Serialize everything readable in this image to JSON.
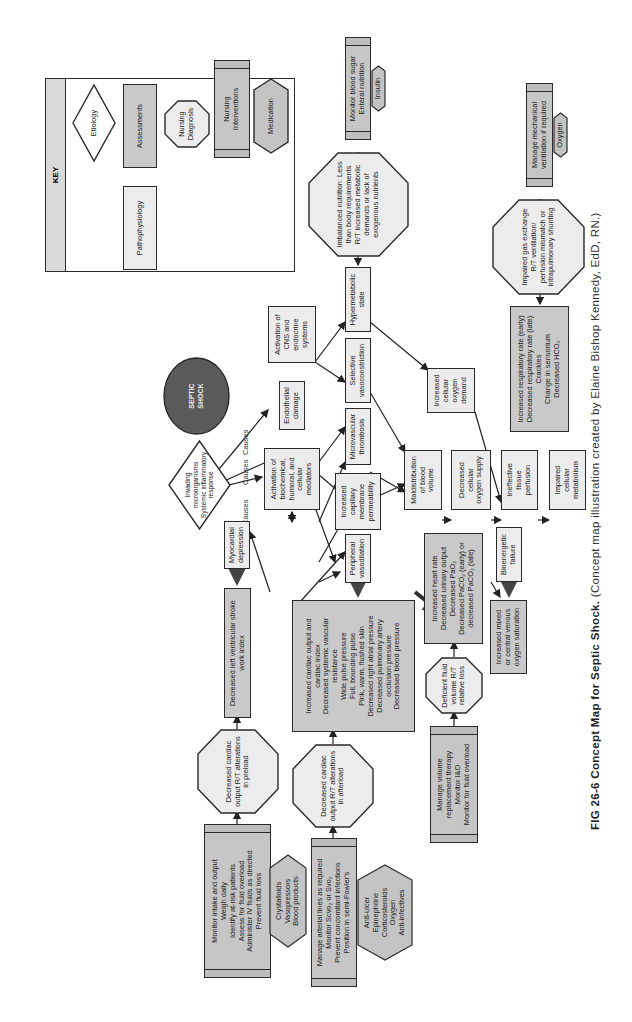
{
  "title": "SEPTIC SHOCK",
  "caption": {
    "label": "FIG 26-6  Concept Map for Septic Shock.",
    "credit": " (Concept map illustration created by Elaine Bishop Kennedy, EdD, RN.)"
  },
  "key": {
    "heading": "KEY",
    "etiology": "Etiology",
    "assessments": "Assessments",
    "pathophysiology": "Pathophysiology",
    "nursing_diagnosis": "Nursing\nDiagnosis",
    "nursing_interventions": "Nursing\nInterventions",
    "medication": "Medication"
  },
  "etiology": "Invading\nmicroorganisms\nSystemic inflammatory\nresponse",
  "causes_label": "Causes",
  "pathophysiology": {
    "activation_cns": "Activation of\nCNS and\nendocrine\nsystems",
    "endothelial": "Endothelial\ndamage",
    "activation_mediators": "Activation of\nbiochemical,\nhumoral, and\ncellular\nmediators",
    "hypermetabolic": "Hypermetabolic\nstate",
    "selective_vaso": "Selective\nvasoconstriction",
    "microvascular": "Microvascular\nthrombosis",
    "capillary": "Increased\ncapillary\nmembrane\npermeability",
    "myocardial": "Myocardial\ndepression",
    "peripheral": "Peripheral\nvasodilation",
    "o2_demand": "Increased\ncellular\noxygen\ndemand",
    "maldistribution": "Maldistribution\nof blood\nvolume",
    "o2_supply": "Decreased\ncellular\noxygen supply",
    "ineffective": "Ineffective\ntissue\nperfusion",
    "impaired_metab": "Impaired\ncellular\nmetabolism",
    "bioenergetic": "Bioenergetic\nfailure"
  },
  "assessments": {
    "resp": "Increased respiratory rate (early)\nDecreased respiratory rate (late)\nCrackles\nChange in sensorium\nDecreased HCO₃",
    "lvswi": "Decreased left ventricular stroke\nwork index",
    "cardiac": "Increased cardiac output and\ncardiac index\nDecreased systemic vascular\nresistance\nWide pulse pressure\nFull, bounding pulse\nPink, warm, flushed skin\nDecreased right atrial pressure\nDecreased pulmonary artery\nocclusion pressure\nDecreased blood pressure",
    "heart_rate": "Increased heart rate\nDecreased urinary output\nDecreased PaO₂\nDecreased PaCO₂ (early) or\ndecreased PaCO₂ (late)",
    "mixed_venous": "Increased mixed\nor central venous\noxygen saturation"
  },
  "diagnoses": {
    "nutrition": "Imbalanced nutrition: Less\nthan body requirements\nR/T increased metabolic\ndemands or lack of\nexogenous nutrients",
    "gas": "Impaired gas exchange\nR/T ventilation/\nperfusion mismatch or\nintrapulmonary shunting",
    "preload": "Decreased cardiac\noutput R/T alterations\nin preload",
    "afterload": "Decreased cardiac\noutput R/T alterations\nin afterload",
    "fluid": "Deficient fluid\nvolume R/T\nrelative loss"
  },
  "interventions": {
    "blood_sugar": "Monitor blood sugar\nEnteral nutrition",
    "ventilation": "Manage mechanical\nventilation if required",
    "intake": "Monitor intake and output\nWeigh daily\nIdentify at-risk patients\nAssess for fluid overload\nAdminister IV fluids as directed\nPrevent fluid loss",
    "arterial": "Manage arterial lines as required\nMonitor Scvo₂ or Svo₂\nPrevent concomitant infections\nPosition in semi-Fowler's",
    "volume": "Manage volume\nreplacement therapy\nMonitor I&O\nMonitor for fluid overload"
  },
  "medications": {
    "insulin": "Insulin",
    "oxygen": "Oxygen",
    "fluids": "Crystalloids\nVasopressors\nBlood products",
    "drugs": "Anti-ulcer\nEpinephrine\nCorticosteroids\nOxygen\nAnti-infectives"
  },
  "colors": {
    "pathophysiology_fill": "#ececec",
    "assessment_fill": "#c9c9c9",
    "intervention_fill": "#c6c6c6",
    "medication_fill": "#c4c4c4",
    "diagnosis_fill": "#ececec",
    "septic_shock_fill": "#5a5a5a",
    "stroke": "#2a2a2a"
  }
}
